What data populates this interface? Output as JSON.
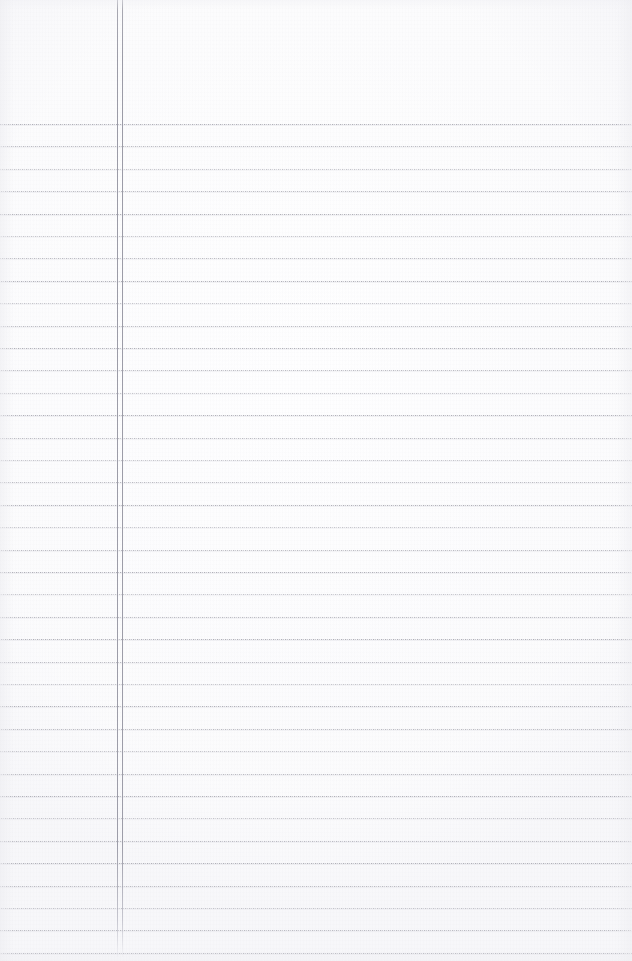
{
  "document": {
    "kind": "scanned-ruled-notebook-page",
    "title": "Blank Ruled Notebook Page",
    "content_text": "",
    "handwriting_present": "none",
    "page_width": 632,
    "page_height": 961
  },
  "paper": {
    "background_color": "#ffffff",
    "tone_color": "#fdfdfe",
    "edge_shadow_color": "#ecece f"
  },
  "ruling": {
    "style": "dotted-horizontal-rules",
    "line_color": "#acacb4",
    "line_halo_color": "#cdcdd4",
    "line_thickness_px": 1,
    "first_line_y": 124,
    "line_spacing_px": 22.4,
    "line_count": 38,
    "extends_full_width": "yes",
    "left_edge_x": 0,
    "right_edge_x": 632,
    "densities": [
      "strong",
      "mid",
      "faint",
      "mid",
      "strong",
      "faint",
      "mid",
      "strong",
      "faint",
      "mid",
      "strong",
      "mid",
      "faint",
      "strong",
      "mid",
      "faint",
      "mid",
      "strong",
      "faint",
      "mid",
      "strong",
      "faint",
      "mid",
      "strong",
      "mid",
      "faint",
      "strong",
      "mid",
      "faint",
      "mid",
      "strong",
      "faint",
      "mid",
      "strong",
      "mid",
      "faint",
      "mid",
      "strong"
    ]
  },
  "margin": {
    "style": "double-vertical-rule",
    "color": "#97979f",
    "left_rule_x": 117,
    "right_rule_x": 122,
    "gap_px": 5,
    "top_y": 0,
    "bottom_y": 957,
    "thickness_px": 1
  },
  "regions": {
    "header_band_label": "blank header band",
    "header_band_height": 124,
    "margin_column_label": "left margin column",
    "writing_area_label": "ruled writing area"
  }
}
